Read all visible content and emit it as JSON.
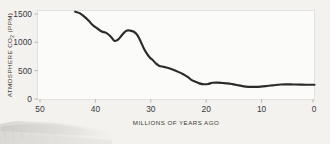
{
  "figure": {
    "background_color": "#f3f2ef",
    "plot_background_color": "#fbfbfa",
    "line_color": "#2b2b2b",
    "text_color": "#39393a"
  },
  "decor": {
    "ghost_photo_name": "faint-pier-photograph"
  },
  "chart_data": {
    "type": "line",
    "title": "",
    "subtitle": "",
    "xlabel": "MILLIONS OF YEARS AGO",
    "ylabel_prefix": "ATMOSPHERE CO",
    "ylabel_subscript": "2",
    "ylabel_suffix": " (PPM)",
    "ylabel": "ATMOSPHERE CO2 (PPM)",
    "xlim": [
      50,
      0
    ],
    "ylim": [
      0,
      1500
    ],
    "x_ticks": [
      50,
      40,
      30,
      20,
      10,
      0
    ],
    "x_tick_labels": [
      "50",
      "40",
      "30",
      "20",
      "10",
      "0"
    ],
    "y_ticks": [
      0,
      500,
      1000,
      1500
    ],
    "y_tick_labels": [
      "0",
      "500",
      "1000",
      "1500"
    ],
    "x_axis_inverted": true,
    "grid": false,
    "legend": null,
    "series": [
      {
        "name": "Atmospheric CO2",
        "x": [
          43.2,
          42.4,
          41.6,
          40.8,
          40.0,
          39.2,
          38.4,
          37.6,
          36.8,
          36.1,
          35.4,
          34.7,
          34.0,
          33.3,
          32.6,
          32.0,
          31.4,
          30.8,
          30.2,
          29.7,
          29.2,
          28.6,
          28.0,
          27.2,
          26.4,
          25.5,
          24.6,
          23.7,
          22.9,
          22.3,
          21.6,
          20.8,
          20.0,
          19.2,
          18.4,
          17.5,
          16.6,
          15.7,
          14.8,
          14.0,
          13.2,
          12.4,
          11.5,
          10.6,
          9.7,
          8.8,
          7.9,
          7.0,
          6.1,
          5.2,
          4.3,
          3.4,
          2.5,
          1.6,
          0.8,
          0.0
        ],
        "y": [
          1480,
          1455,
          1400,
          1330,
          1250,
          1195,
          1145,
          1120,
          1060,
          985,
          1010,
          1090,
          1155,
          1160,
          1140,
          1085,
          980,
          855,
          760,
          700,
          660,
          600,
          560,
          545,
          525,
          495,
          460,
          420,
          375,
          330,
          295,
          265,
          250,
          255,
          275,
          278,
          272,
          265,
          252,
          238,
          222,
          210,
          205,
          205,
          210,
          218,
          228,
          238,
          245,
          248,
          248,
          245,
          243,
          242,
          242,
          242
        ]
      }
    ]
  }
}
